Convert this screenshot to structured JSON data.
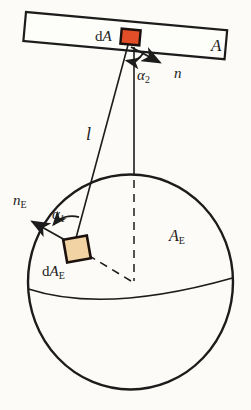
{
  "figure": {
    "background": "#fcfbf7",
    "ink": "#1c1c1c",
    "plate": {
      "fill": "#fdfdfa",
      "label": "A",
      "element_label": {
        "prefix": "d",
        "symbol": "A"
      },
      "element_fill": "#e14e28"
    },
    "sphere": {
      "label": {
        "symbol": "A",
        "sub": "E"
      },
      "element_label": {
        "prefix": "d",
        "symbol": "A",
        "sub": "E"
      },
      "element_fill": "#f2d3a3"
    },
    "normals": {
      "plate": {
        "symbol": "n"
      },
      "sphere": {
        "symbol": "n",
        "sub": "E"
      }
    },
    "angles": {
      "alpha1": {
        "symbol": "α",
        "sub": "1"
      },
      "alpha2": {
        "symbol": "α",
        "sub": "2"
      }
    },
    "distance": {
      "symbol": "l"
    }
  }
}
